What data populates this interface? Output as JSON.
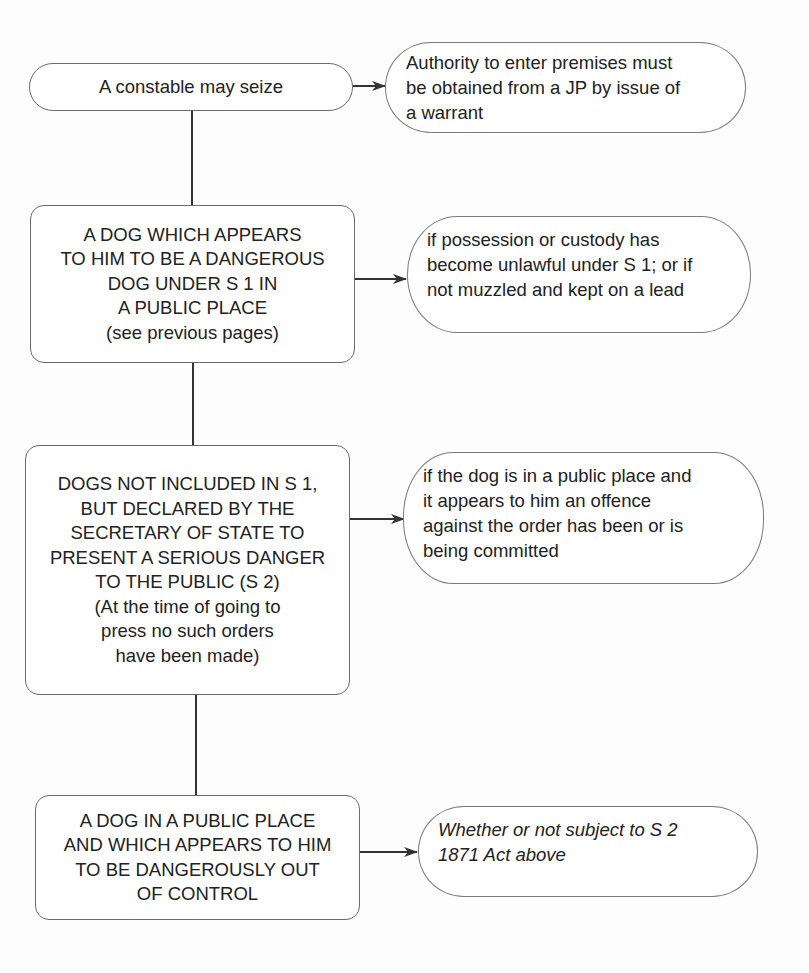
{
  "diagram": {
    "root": {
      "label": "A constable may seize",
      "note": {
        "lines": [
          "Authority to enter premises must",
          "be obtained from a JP by issue of",
          "a warrant"
        ]
      }
    },
    "cases": [
      {
        "lines": [
          "A DOG WHICH APPEARS",
          "TO HIM TO BE A DANGEROUS",
          "DOG UNDER S 1 IN",
          "A PUBLIC PLACE",
          "(see previous pages)"
        ],
        "note": {
          "lines": [
            "if possession or custody has",
            "become unlawful under S 1; or if",
            "not muzzled and kept on a lead"
          ]
        }
      },
      {
        "lines": [
          "DOGS NOT INCLUDED IN S 1,",
          "BUT DECLARED BY THE",
          "SECRETARY OF STATE TO",
          "PRESENT A SERIOUS DANGER",
          "TO THE PUBLIC (S 2)",
          "(At the time of going to",
          "press no such orders",
          "have been made)"
        ],
        "note": {
          "lines": [
            "if the dog is in a public place and",
            "it appears to him an offence",
            "against the order has been or is",
            "being committed"
          ]
        }
      },
      {
        "lines": [
          "A DOG IN A PUBLIC PLACE",
          "AND WHICH APPEARS TO HIM",
          "TO BE DANGEROUSLY OUT",
          "OF CONTROL"
        ],
        "note": {
          "italic": true,
          "lines": [
            "Whether or not subject to S 2",
            "1871 Act above"
          ]
        }
      }
    ]
  },
  "colors": {
    "background": "#fdfdfd",
    "stroke": "#333333",
    "border": "#6a6a6a",
    "text": "#222222"
  }
}
